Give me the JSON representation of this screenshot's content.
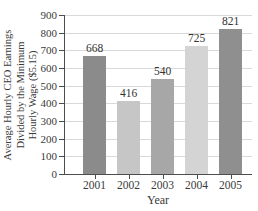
{
  "chart_data": {
    "type": "bar",
    "title": "",
    "categories": [
      "2001",
      "2002",
      "2003",
      "2004",
      "2005"
    ],
    "values": [
      668,
      416,
      540,
      725,
      821
    ],
    "value_labels": [
      "668",
      "416",
      "540",
      "725",
      "821"
    ],
    "bar_colors": [
      "#8b8b8b",
      "#c6c6c6",
      "#a7a7a7",
      "#d4d4d4",
      "#8f8f8f"
    ],
    "xlabel": "Year",
    "ylabel": "Average Hourly CEO Earnings Divided by the Minimum Hourly Wage ($5.15)",
    "ylabel_lines": [
      "Average Hourly CEO Earnings",
      "Divided by the Minimum",
      "Hourly Wage ($5.15)"
    ],
    "ylim": [
      0,
      900
    ],
    "ytick_step": 100,
    "yticks": [
      0,
      100,
      200,
      300,
      400,
      500,
      600,
      700,
      800,
      900
    ],
    "grid": true,
    "legend": "none",
    "colors": {
      "axis": "#4d4d4d",
      "grid": "#d9d9d9",
      "text": "#3a3a3a",
      "background": "#ffffff"
    }
  }
}
